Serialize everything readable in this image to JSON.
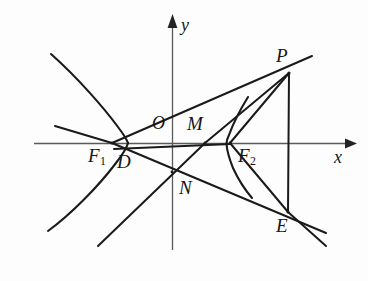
{
  "figure": {
    "background_color": "#fdfdfd",
    "stroke_color": "#1a1a1a",
    "axis_color": "#555555",
    "axes": {
      "x_label": "x",
      "y_label": "y",
      "origin_label": "O",
      "x_axis_y": 143,
      "y_axis_x": 172,
      "x_arrow_tip_x": 349,
      "y_arrow_tip_y": 14
    },
    "points": [
      {
        "name": "P",
        "label": "P",
        "x": 289,
        "y": 73,
        "label_x": 276,
        "label_y": 46
      },
      {
        "name": "E",
        "label": "E",
        "x": 288,
        "y": 212,
        "label_x": 276,
        "label_y": 216
      },
      {
        "name": "O",
        "label": "O",
        "x": 172,
        "y": 143,
        "label_x": 152,
        "label_y": 114
      },
      {
        "name": "M",
        "label": "M",
        "x": 205,
        "y": 143,
        "label_x": 187,
        "label_y": 114
      },
      {
        "name": "N",
        "label": "N",
        "x": 172,
        "y": 172,
        "label_x": 179,
        "label_y": 178
      },
      {
        "name": "D",
        "label": "D",
        "x": 130,
        "y": 146,
        "label_x": 117,
        "label_y": 152
      },
      {
        "name": "F1",
        "label": "F",
        "sub": "1",
        "x": 112,
        "y": 143,
        "label_x": 88,
        "label_y": 146
      },
      {
        "name": "F2",
        "label": "F",
        "sub": "2",
        "x": 230,
        "y": 143,
        "label_x": 238,
        "label_y": 146
      }
    ],
    "segments": [
      {
        "name": "F1-P",
        "from": "F1",
        "to": "P"
      },
      {
        "name": "P-M",
        "from": "P",
        "to": "M"
      },
      {
        "name": "P-F2",
        "from": "P",
        "to": "F2"
      },
      {
        "name": "P-E",
        "from": "P",
        "to": "E"
      },
      {
        "name": "F2-E",
        "from": "F2",
        "to": "E"
      },
      {
        "name": "D-M-F2",
        "from": "D",
        "to": "F2"
      },
      {
        "name": "F1-N-E",
        "from": "F1",
        "to": "E"
      }
    ],
    "curves": [
      {
        "name": "left-branch",
        "description": "left branch of hyperbola, vertex near x = 127"
      },
      {
        "name": "right-branch",
        "description": "right branch of hyperbola, vertex near x = 227"
      }
    ]
  }
}
